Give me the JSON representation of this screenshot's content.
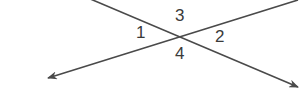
{
  "diagram": {
    "type": "intersecting-lines",
    "line_color": "#4a4a4a",
    "label_color": "#3a3a3a",
    "lines": [
      {
        "name": "line-descending",
        "from": [
          88,
          -2
        ],
        "to": [
          300,
          90
        ],
        "arrow_end": true
      },
      {
        "name": "line-ascending",
        "from": [
          48,
          78
        ],
        "to": [
          300,
          0
        ],
        "arrow_start": true,
        "arrow_end": true
      }
    ],
    "intersection": [
      177,
      35
    ],
    "angle_labels": {
      "a1": "1",
      "a2": "2",
      "a3": "3",
      "a4": "4"
    }
  }
}
